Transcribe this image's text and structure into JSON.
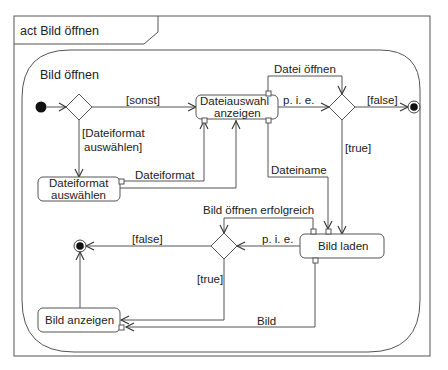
{
  "frame": {
    "title": "act Bild öffnen"
  },
  "activity": {
    "name": "Bild öffnen"
  },
  "actions": {
    "dateiauswahl": {
      "line1": "Dateiauswahl",
      "line2": "anzeigen"
    },
    "dateiformat": {
      "line1": "Dateiformat",
      "line2": "auswählen"
    },
    "bild_laden": {
      "label": "Bild laden"
    },
    "bild_anzeigen": {
      "label": "Bild anzeigen"
    }
  },
  "edges": {
    "sonst": "[sonst]",
    "dateiformat_guard_1": "[Dateiformat",
    "dateiformat_guard_2": "auswählen]",
    "dateiformat_obj": "Dateiformat",
    "datei_oeffnen": "Datei öffnen",
    "pie1": "p. i. e.",
    "false1": "[false]",
    "true1": "[true]",
    "dateiname": "Dateiname",
    "bild_oeffnen_erfolgreich": "Bild öffnen erfolgreich",
    "pie2": "p. i. e.",
    "false2": "[false]",
    "true2": "[true]",
    "bild": "Bild"
  }
}
